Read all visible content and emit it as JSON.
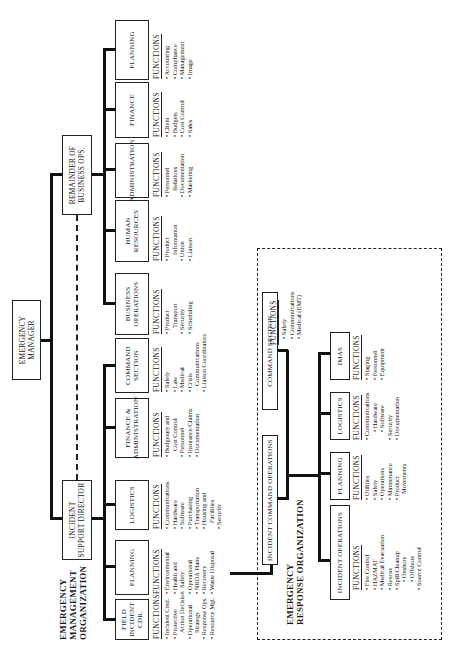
{
  "emo": {
    "title_lines": [
      "EMERGENCY",
      "MANAGEMENT",
      "ORGANIZATION"
    ],
    "emergency_manager": [
      "EMERGENCY",
      "MANAGER"
    ],
    "incident_support_director": [
      "INCIDENT",
      "SUPPORT DIRECTOR"
    ],
    "remainder": [
      "REMAINDER OF",
      "BUSINESS OPS."
    ],
    "functions_label": "FUNCTIONS",
    "units": [
      {
        "name": [
          "FIELD",
          "INCIDENT CDR."
        ],
        "functions": [
          "• Incident Cmd.",
          "• Protective",
          "~Action Decision",
          "• Operational",
          "~Strategy",
          "• Response Ops.",
          "• Resource Mgt."
        ]
      },
      {
        "name": [
          "PLANNING"
        ],
        "functions": [
          "• Environmental",
          "• Health and",
          "~Safety",
          "• Operational",
          "• NRDA Plans",
          "• Recovery",
          "• Waste Disposal"
        ]
      },
      {
        "name": [
          "LOGISTICS"
        ],
        "functions": [
          "• Communications",
          "• Hardware",
          "• Software",
          "• Purchasing",
          "• Transportation",
          "• Housing and",
          "~Facilities",
          "• Security"
        ]
      },
      {
        "name": [
          "FINANCE &",
          "ADMINISTRATION"
        ],
        "functions": [
          "• Budgetary and",
          "~Cost Control",
          "• Personnel",
          "• Insurance/Claims",
          "• Documentation"
        ]
      },
      {
        "name": [
          "COMMAND",
          "SECTION"
        ],
        "functions": [
          "• Safety",
          "• Law",
          "• Medical",
          "• Crisis",
          "~Communications",
          "• Liaison Coordinators"
        ]
      },
      {
        "name": [
          "BUSINESS",
          "OPERATIONS"
        ],
        "functions": [
          "• Product",
          "~Transport",
          "• Security",
          "• Scheduling"
        ]
      },
      {
        "name": [
          "HUMAN",
          "RESOURCES"
        ],
        "functions": [
          "• Product",
          "~Information",
          "• Union",
          "• Liaison"
        ]
      },
      {
        "name": [
          "ADMINISTRATION"
        ],
        "functions": [
          "• Personnel",
          "~Relations",
          "• Documentation",
          "• Marketing"
        ]
      },
      {
        "name": [
          "FINANCE"
        ],
        "functions": [
          "• Client",
          "• Budgets",
          "• Cost Control",
          "• Sales"
        ]
      },
      {
        "name": [
          "PLANNING"
        ],
        "functions": [
          "• Accounting",
          "• Compliance",
          "• Management",
          "• Image"
        ]
      }
    ]
  },
  "ero": {
    "title_lines": [
      "EMERGENCY",
      "RESPONSE ORGANIZATION"
    ],
    "incident_command_operations": "INCIDENT  COMMAND OPERATIONS",
    "command_section": "COMMAND SECTION",
    "command_functions": [
      "• Safety",
      "• Communications",
      "• Medical (EMT)"
    ],
    "units": [
      {
        "name": "INCIDENT OPERATIONS",
        "functions": [
          "• Fire Control",
          "• HAZMAT",
          "• Medical Evacuation",
          "• Rescue",
          "• Spill Cleanup",
          "^• Onshore",
          "^• Offshore",
          "• Source Control"
        ]
      },
      {
        "name": "PLANNING",
        "functions": [
          "• Utilities",
          "• Safety",
          "• Operations",
          "• Maintenance",
          "• Product",
          "~Movements"
        ]
      },
      {
        "name": "LOGISTICS",
        "functions": [
          "• Communications",
          "^• Hardware",
          "^• Software",
          "• Security",
          "• Documentation"
        ]
      },
      {
        "name": "IMAS",
        "functions": [
          "• Staging",
          "• Personnel",
          "• Equipment"
        ]
      }
    ]
  }
}
